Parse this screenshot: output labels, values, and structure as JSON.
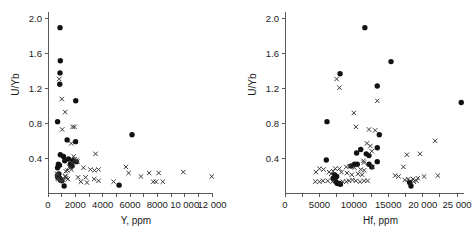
{
  "figure": {
    "background": "#ffffff",
    "marker_filled_color": "#111111",
    "marker_cross_color": "#3a3a3a",
    "axis_color": "#5a5a5a"
  },
  "chart_data": [
    {
      "type": "scatter",
      "panel": "left",
      "title": "",
      "xlabel": "Y, ppm",
      "ylabel": "U/Yb",
      "xlim": [
        0,
        12000
      ],
      "ylim": [
        0,
        2.08
      ],
      "grid": false,
      "legend": "none",
      "xticks": [
        0,
        1000,
        2000,
        3000,
        4000,
        5000,
        6000,
        7000,
        8000,
        9000,
        10000,
        11000,
        12000
      ],
      "xtick_labels": [
        "0",
        "",
        "2000",
        "",
        "4000",
        "",
        "6000",
        "",
        "8000",
        "",
        "10 000",
        "",
        "12 000"
      ],
      "yticks": [
        0.4,
        0.8,
        1.2,
        1.6,
        2.0
      ],
      "ytick_labels": [
        "0.4",
        "0.8",
        "1.2",
        "1.6",
        "2.0"
      ],
      "series": [
        {
          "name": "filled-circles",
          "marker": "circle",
          "points": [
            [
              880,
              1.9
            ],
            [
              900,
              1.52
            ],
            [
              880,
              1.38
            ],
            [
              860,
              1.25
            ],
            [
              700,
              0.82
            ],
            [
              2030,
              1.06
            ],
            [
              6150,
              0.67
            ],
            [
              1400,
              0.61
            ],
            [
              2020,
              0.59
            ],
            [
              900,
              0.44
            ],
            [
              1130,
              0.42
            ],
            [
              1230,
              0.37
            ],
            [
              1500,
              0.39
            ],
            [
              1820,
              0.37
            ],
            [
              2080,
              0.36
            ],
            [
              760,
              0.33
            ],
            [
              840,
              0.32
            ],
            [
              700,
              0.29
            ],
            [
              1640,
              0.33
            ],
            [
              1760,
              0.31
            ],
            [
              690,
              0.2
            ],
            [
              720,
              0.18
            ],
            [
              760,
              0.19
            ],
            [
              800,
              0.22
            ],
            [
              850,
              0.17
            ],
            [
              900,
              0.16
            ],
            [
              1000,
              0.14
            ],
            [
              1180,
              0.08
            ],
            [
              5200,
              0.09
            ]
          ]
        },
        {
          "name": "crosses",
          "marker": "x",
          "points": [
            [
              820,
              1.31
            ],
            [
              1010,
              1.08
            ],
            [
              1260,
              0.93
            ],
            [
              1040,
              0.73
            ],
            [
              1800,
              0.76
            ],
            [
              1940,
              0.76
            ],
            [
              1700,
              0.57
            ],
            [
              3480,
              0.45
            ],
            [
              1880,
              0.42
            ],
            [
              1960,
              0.39
            ],
            [
              2100,
              0.38
            ],
            [
              2160,
              0.36
            ],
            [
              1750,
              0.35
            ],
            [
              1560,
              0.3
            ],
            [
              1640,
              0.29
            ],
            [
              1700,
              0.27
            ],
            [
              1430,
              0.26
            ],
            [
              1300,
              0.25
            ],
            [
              2600,
              0.29
            ],
            [
              3100,
              0.27
            ],
            [
              3400,
              0.26
            ],
            [
              3700,
              0.27
            ],
            [
              5700,
              0.3
            ],
            [
              5900,
              0.23
            ],
            [
              6800,
              0.19
            ],
            [
              7400,
              0.23
            ],
            [
              8100,
              0.23
            ],
            [
              9900,
              0.24
            ],
            [
              11980,
              0.19
            ],
            [
              680,
              0.22
            ],
            [
              720,
              0.21
            ],
            [
              700,
              0.17
            ],
            [
              760,
              0.16
            ],
            [
              880,
              0.15
            ],
            [
              960,
              0.14
            ],
            [
              1030,
              0.14
            ],
            [
              1120,
              0.15
            ],
            [
              1330,
              0.17
            ],
            [
              1460,
              0.16
            ],
            [
              2200,
              0.18
            ],
            [
              2400,
              0.13
            ],
            [
              2750,
              0.18
            ],
            [
              2850,
              0.12
            ],
            [
              3380,
              0.16
            ],
            [
              3700,
              0.14
            ],
            [
              4800,
              0.13
            ],
            [
              7700,
              0.13
            ],
            [
              7900,
              0.13
            ],
            [
              8400,
              0.13
            ],
            [
              1240,
              0.19
            ],
            [
              1300,
              0.19
            ]
          ]
        }
      ]
    },
    {
      "type": "scatter",
      "panel": "right",
      "title": "",
      "xlabel": "Hf, ppm",
      "ylabel": "U/Yb",
      "xlim": [
        0,
        26000
      ],
      "ylim": [
        0,
        2.08
      ],
      "grid": false,
      "legend": "none",
      "xticks": [
        0,
        2500,
        5000,
        7500,
        10000,
        12500,
        15000,
        17500,
        20000,
        22500,
        25000
      ],
      "xtick_labels": [
        "0",
        "",
        "5000",
        "",
        "10000",
        "",
        "15000",
        "",
        "20 000",
        "",
        "25 000"
      ],
      "yticks": [
        0.4,
        0.8,
        1.2,
        1.6,
        2.0
      ],
      "ytick_labels": [
        "0.4",
        "0.8",
        "1.2",
        "1.6",
        "2.0"
      ],
      "series": [
        {
          "name": "filled-circles",
          "marker": "circle",
          "points": [
            [
              11600,
              1.9
            ],
            [
              15400,
              1.51
            ],
            [
              8000,
              1.37
            ],
            [
              13400,
              1.23
            ],
            [
              25600,
              1.04
            ],
            [
              6100,
              0.82
            ],
            [
              13700,
              0.67
            ],
            [
              13400,
              0.52
            ],
            [
              11000,
              0.5
            ],
            [
              10400,
              0.46
            ],
            [
              11800,
              0.45
            ],
            [
              12200,
              0.43
            ],
            [
              6000,
              0.38
            ],
            [
              13400,
              0.36
            ],
            [
              12200,
              0.33
            ],
            [
              10500,
              0.33
            ],
            [
              10100,
              0.33
            ],
            [
              9600,
              0.31
            ],
            [
              12600,
              0.3
            ],
            [
              7200,
              0.21
            ],
            [
              7500,
              0.19
            ],
            [
              7000,
              0.17
            ],
            [
              7400,
              0.13
            ],
            [
              7600,
              0.11
            ],
            [
              7900,
              0.11
            ],
            [
              8050,
              0.1
            ],
            [
              18100,
              0.12
            ],
            [
              18300,
              0.08
            ]
          ]
        },
        {
          "name": "crosses",
          "marker": "x",
          "points": [
            [
              7500,
              1.31
            ],
            [
              7900,
              1.21
            ],
            [
              13400,
              1.06
            ],
            [
              10000,
              0.92
            ],
            [
              10300,
              0.76
            ],
            [
              12200,
              0.73
            ],
            [
              13100,
              0.72
            ],
            [
              11900,
              0.57
            ],
            [
              12400,
              0.54
            ],
            [
              12600,
              0.48
            ],
            [
              17700,
              0.44
            ],
            [
              21800,
              0.6
            ],
            [
              19600,
              0.45
            ],
            [
              11400,
              0.37
            ],
            [
              11450,
              0.35
            ],
            [
              12700,
              0.3
            ],
            [
              17200,
              0.3
            ],
            [
              5000,
              0.28
            ],
            [
              5600,
              0.27
            ],
            [
              7300,
              0.28
            ],
            [
              7900,
              0.28
            ],
            [
              8900,
              0.3
            ],
            [
              9400,
              0.31
            ],
            [
              10100,
              0.29
            ],
            [
              11000,
              0.27
            ],
            [
              11500,
              0.26
            ],
            [
              4500,
              0.24
            ],
            [
              6400,
              0.24
            ],
            [
              6700,
              0.22
            ],
            [
              7000,
              0.25
            ],
            [
              8200,
              0.24
            ],
            [
              9000,
              0.23
            ],
            [
              9700,
              0.21
            ],
            [
              10600,
              0.22
            ],
            [
              11200,
              0.21
            ],
            [
              16000,
              0.2
            ],
            [
              16500,
              0.19
            ],
            [
              17900,
              0.16
            ],
            [
              18600,
              0.16
            ],
            [
              19300,
              0.17
            ],
            [
              20200,
              0.19
            ],
            [
              22200,
              0.2
            ],
            [
              4400,
              0.13
            ],
            [
              5000,
              0.13
            ],
            [
              5500,
              0.14
            ],
            [
              6200,
              0.14
            ],
            [
              6900,
              0.13
            ],
            [
              8400,
              0.13
            ],
            [
              8900,
              0.13
            ],
            [
              9300,
              0.14
            ],
            [
              9800,
              0.15
            ],
            [
              10300,
              0.14
            ],
            [
              10900,
              0.13
            ],
            [
              11500,
              0.14
            ],
            [
              12000,
              0.14
            ],
            [
              17400,
              0.15
            ],
            [
              18700,
              0.13
            ],
            [
              19100,
              0.14
            ]
          ]
        }
      ]
    }
  ]
}
